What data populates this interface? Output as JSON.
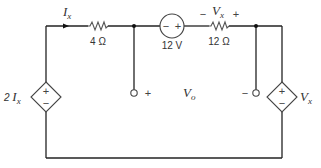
{
  "diagram": {
    "type": "circuit-schematic",
    "components": {
      "resistor_left": {
        "label": "4 Ω"
      },
      "voltage_source": {
        "label": "12 V",
        "polarity_left": "−",
        "polarity_right": "+"
      },
      "resistor_right": {
        "label": "12 Ω",
        "voltage_label": "V",
        "voltage_sub": "x",
        "polarity_left": "−",
        "polarity_right": "+"
      },
      "dep_source_left": {
        "label_coef": "2 ",
        "label_var": "I",
        "label_sub": "x",
        "plus": "+",
        "minus": "−"
      },
      "dep_source_right": {
        "label_var": "V",
        "label_sub": "x",
        "plus": "+",
        "minus": "−"
      }
    },
    "current": {
      "label_var": "I",
      "label_sub": "x"
    },
    "output": {
      "label_var": "V",
      "label_sub": "o",
      "plus": "+",
      "minus": "−"
    }
  }
}
